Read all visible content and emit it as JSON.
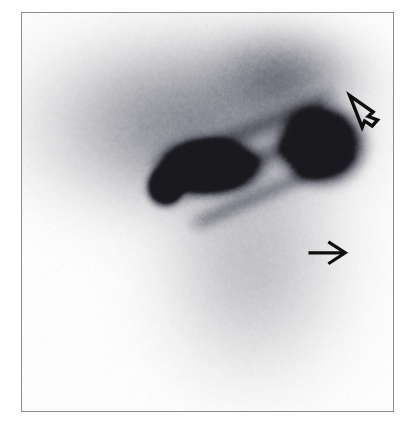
{
  "figure": {
    "modality": "nuclear-medicine-scintigraphy",
    "view": "anterior thoracic",
    "background_color": "#ffffff",
    "frame": {
      "border_color": "#8d8d90",
      "x": 21,
      "y": 12,
      "width": 373,
      "height": 400
    }
  },
  "image_data": {
    "type": "grayscale-scintigram",
    "colormap": "inverted-gray-blue",
    "palette": {
      "film_background": "#fefeff",
      "faint_uptake": "#eceef4",
      "low_uptake": "#dcdee8",
      "mid_uptake": "#c4c6d2",
      "high_uptake": "#8a8c98",
      "hot_focus": "#1a1a1f",
      "noise_tint": "#b9bfd2"
    },
    "regions": [
      {
        "name": "diffuse-thoracic-uptake",
        "description": "broad diffuse soft-tissue / skeletal uptake across upper half",
        "cx": 0.46,
        "cy": 0.28,
        "rx": 0.4,
        "ry": 0.22,
        "intensity": "mid"
      },
      {
        "name": "upper-right-dome",
        "description": "rounded dome of uptake at upper right (shoulder / apical)",
        "cx": 0.7,
        "cy": 0.16,
        "rx": 0.2,
        "ry": 0.12,
        "intensity": "mid"
      },
      {
        "name": "lower-body-faint",
        "description": "faint tapering abdominal / pelvic activity in lower half",
        "cx": 0.62,
        "cy": 0.62,
        "rx": 0.26,
        "ry": 0.3,
        "intensity": "faint"
      }
    ],
    "linear_bands": [
      {
        "name": "rib-band-1",
        "x1": 0.34,
        "y1": 0.4,
        "x2": 0.86,
        "y2": 0.2,
        "width": 0.035
      },
      {
        "name": "rib-band-2",
        "x1": 0.38,
        "y1": 0.47,
        "x2": 0.88,
        "y2": 0.27,
        "width": 0.032
      },
      {
        "name": "rib-band-3",
        "x1": 0.44,
        "y1": 0.54,
        "x2": 0.9,
        "y2": 0.35,
        "width": 0.03
      }
    ],
    "focal_hotspots": [
      {
        "name": "hotspot-left-small",
        "cx": 0.385,
        "cy": 0.435,
        "rx": 0.035,
        "ry": 0.035,
        "intensity": "hot"
      },
      {
        "name": "hotspot-central-elongated",
        "cx": 0.505,
        "cy": 0.385,
        "rx": 0.095,
        "ry": 0.05,
        "intensity": "hot"
      },
      {
        "name": "hotspot-right-large",
        "cx": 0.805,
        "cy": 0.33,
        "rx": 0.08,
        "ry": 0.068,
        "intensity": "hot"
      }
    ]
  },
  "annotations": [
    {
      "name": "open-arrow-upper-right",
      "style": "outline",
      "direction": "down-left",
      "color": "#0d0d0d",
      "points_to": "hotspot-right-large",
      "x": 0.885,
      "y": 0.23
    },
    {
      "name": "solid-arrow-lower",
      "style": "solid-line",
      "direction": "right",
      "color": "#0d0d0d",
      "points_to": "lower-body-faint",
      "x": 0.775,
      "y": 0.605
    }
  ]
}
